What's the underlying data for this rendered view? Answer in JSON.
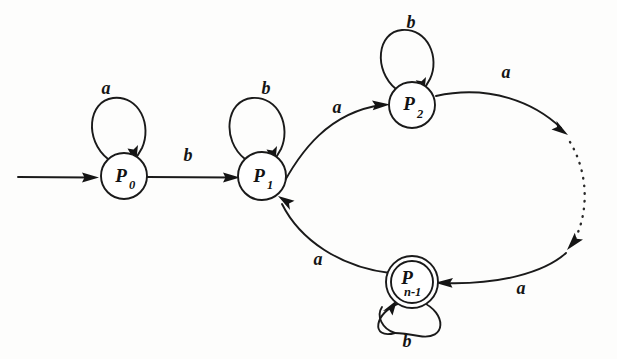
{
  "diagram": {
    "type": "finite-state-automaton",
    "title": "",
    "background_color": "#fdfdfc",
    "ink_color": "#1a1a1a",
    "alphabet": [
      "a",
      "b"
    ],
    "start_state": "P_0",
    "accepting_states": [
      "P_n-1"
    ],
    "states": [
      {
        "id": "P0",
        "label": "P",
        "subscript": "0",
        "cx": 124,
        "cy": 176,
        "r": 23,
        "accepting": false
      },
      {
        "id": "P1",
        "label": "P",
        "subscript": "1",
        "cx": 262,
        "cy": 176,
        "r": 24,
        "accepting": false
      },
      {
        "id": "P2",
        "label": "P",
        "subscript": "2",
        "cx": 412,
        "cy": 105,
        "r": 23,
        "accepting": false
      },
      {
        "id": "Pn1",
        "label": "P",
        "subscript": "n-1",
        "cx": 412,
        "cy": 282,
        "r": 22,
        "accepting": true
      }
    ],
    "transitions": [
      {
        "from": "start",
        "to": "P0",
        "symbol": "",
        "kind": "start-arrow"
      },
      {
        "from": "P0",
        "to": "P0",
        "symbol": "a",
        "kind": "self-loop",
        "label_x": 106,
        "label_y": 94
      },
      {
        "from": "P0",
        "to": "P1",
        "symbol": "b",
        "kind": "straight",
        "label_x": 188,
        "label_y": 161
      },
      {
        "from": "P1",
        "to": "P1",
        "symbol": "b",
        "kind": "self-loop",
        "label_x": 266,
        "label_y": 94
      },
      {
        "from": "P1",
        "to": "P2",
        "symbol": "a",
        "kind": "arc",
        "label_x": 337,
        "label_y": 113
      },
      {
        "from": "P2",
        "to": "P2",
        "symbol": "b",
        "kind": "self-loop",
        "label_x": 411,
        "label_y": 28
      },
      {
        "from": "P2",
        "to": "ellipsis",
        "symbol": "a",
        "kind": "arc",
        "label_x": 506,
        "label_y": 78
      },
      {
        "from": "ellipsis",
        "to": "Pn1",
        "symbol": "a",
        "kind": "arc",
        "label_x": 521,
        "label_y": 294
      },
      {
        "from": "Pn1",
        "to": "P1",
        "symbol": "a",
        "kind": "arc",
        "label_x": 318,
        "label_y": 265
      },
      {
        "from": "Pn1",
        "to": "Pn1",
        "symbol": "b",
        "kind": "self-loop",
        "label_x": 407,
        "label_y": 347
      }
    ],
    "ellipsis": {
      "style": "dotted-arc",
      "meaning": "omitted intermediate states"
    }
  }
}
